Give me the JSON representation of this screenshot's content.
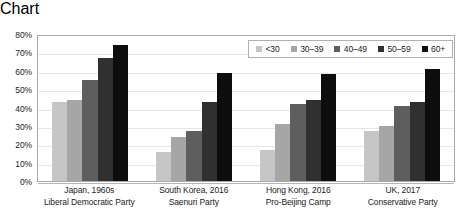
{
  "chart_data": {
    "type": "bar",
    "title": "",
    "subtitle": "",
    "xlabel": "",
    "ylabel": "",
    "ylim": [
      0,
      80
    ],
    "ytick_values": [
      0,
      10,
      20,
      30,
      40,
      50,
      60,
      70,
      80
    ],
    "ytick_labels": [
      "0%",
      "10%",
      "20%",
      "30%",
      "40%",
      "50%",
      "60%",
      "70%",
      "80%"
    ],
    "grid": true,
    "legend_position": "top-right-inside",
    "categories": [
      "Japan, 1960s\nLiberal Democratic Party",
      "South Korea, 2016\nSaenuri Party",
      "Hong Kong, 2016\nPro-Beijing Camp",
      "UK, 2017\nConservative Party"
    ],
    "category_lines": [
      [
        "Japan, 1960s",
        "Liberal Democratic Party"
      ],
      [
        "South Korea, 2016",
        "Saenuri Party"
      ],
      [
        "Hong Kong, 2016",
        "Pro-Beijing Camp"
      ],
      [
        "UK, 2017",
        "Conservative Party"
      ]
    ],
    "series": [
      {
        "name": "<30",
        "color": "#c6c6c6",
        "values": [
          43,
          16,
          17,
          27
        ]
      },
      {
        "name": "30–39",
        "color": "#a6a6a6",
        "values": [
          44,
          24,
          31,
          30
        ]
      },
      {
        "name": "40–49",
        "color": "#5e5e5e",
        "values": [
          55,
          27,
          42,
          41
        ]
      },
      {
        "name": "50–59",
        "color": "#303030",
        "values": [
          67,
          43,
          44,
          43
        ]
      },
      {
        "name": "60+",
        "color": "#0d0d0d",
        "values": [
          74,
          59,
          58,
          61
        ]
      }
    ]
  },
  "style": {
    "plot_border_color": "#aaaaaa",
    "gridline_color": "#e6e6e6",
    "text_color": "#1a1a1a",
    "background": "#ffffff"
  }
}
